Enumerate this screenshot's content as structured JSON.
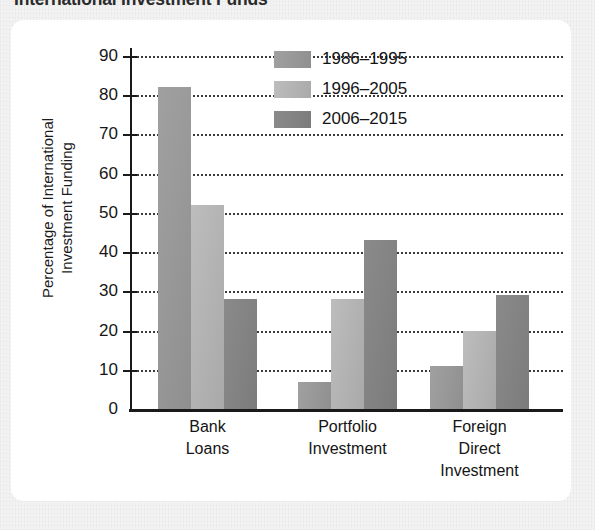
{
  "title": "International Investment Funds",
  "chart_data": {
    "type": "bar",
    "title": "International Investment Funds",
    "xlabel": "",
    "ylabel": "Percentage of International\nInvestment Funding",
    "ylim": [
      0,
      90
    ],
    "yticks": [
      0,
      10,
      20,
      30,
      40,
      50,
      60,
      70,
      80,
      90
    ],
    "ytick_labels": [
      "0",
      "10",
      "20",
      "30",
      "40",
      "50",
      "60",
      "70",
      "80",
      "90"
    ],
    "grid": "horizontal-dotted",
    "legend_position": "upper-right-inside",
    "categories": [
      "Bank\nLoans",
      "Portfolio\nInvestment",
      "Foreign\nDirect\nInvestment"
    ],
    "category_labels": [
      "Bank Loans",
      "Portfolio Investment",
      "Foreign Direct Investment"
    ],
    "series": [
      {
        "name": "1986–1995",
        "color": "#9a9a9a",
        "values": [
          82,
          7,
          11
        ]
      },
      {
        "name": "1996–2005",
        "color": "#b4b4b4",
        "values": [
          52,
          28,
          20
        ]
      },
      {
        "name": "2006–2015",
        "color": "#848484",
        "values": [
          28,
          43,
          29
        ]
      }
    ]
  },
  "legend": {
    "items": [
      {
        "label": "1986–1995"
      },
      {
        "label": "1996–2005"
      },
      {
        "label": "2006–2015"
      }
    ]
  }
}
